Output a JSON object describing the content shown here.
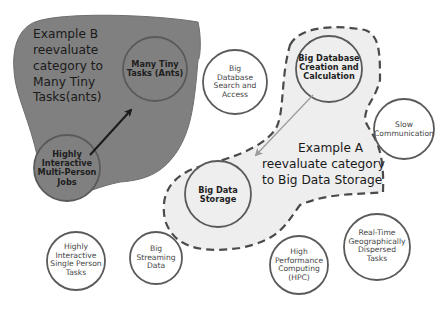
{
  "colors": {
    "region_b_fill": "#808080",
    "region_a_fill": "#eeeeee",
    "circle_stroke": "#5a5a5a",
    "circle_fill_white": "#ffffff",
    "arrow_b": "#1a1a1a",
    "arrow_a": "#9a9a9a"
  },
  "regions": {
    "example_b": {
      "note_lines": [
        "Example B",
        "reevaluate",
        "category  to",
        "Many Tiny",
        "Tasks(ants)"
      ]
    },
    "example_a": {
      "note_lines": [
        "Example A",
        "reevaluate category",
        "to Big Data Storage"
      ]
    }
  },
  "nodes": {
    "many_tiny_tasks": {
      "lines": [
        "Many Tiny",
        "Tasks (Ants)"
      ],
      "style": "bold",
      "region": "example_b"
    },
    "highly_interactive_multi_person": {
      "lines": [
        "Highly",
        "Interactive",
        "Multi-Person",
        "Jobs"
      ],
      "style": "bold",
      "region": "example_b"
    },
    "big_database_search": {
      "lines": [
        "Big",
        "Database",
        "Search and",
        "Access"
      ],
      "style": "small",
      "region": "none"
    },
    "big_database_creation": {
      "lines": [
        "Big Database",
        "Creation and",
        "Calculation"
      ],
      "style": "bold",
      "region": "example_a"
    },
    "big_data_storage": {
      "lines": [
        "Big Data",
        "Storage"
      ],
      "style": "bold",
      "region": "example_a"
    },
    "slow_communication": {
      "lines": [
        "Slow",
        "Communication"
      ],
      "style": "small",
      "region": "none"
    },
    "highly_interactive_single_person": {
      "lines": [
        "Highly",
        "Interactive",
        "Single Person",
        "Tasks"
      ],
      "style": "small",
      "region": "none"
    },
    "big_streaming_data": {
      "lines": [
        "Big",
        "Streaming",
        "Data"
      ],
      "style": "small",
      "region": "none"
    },
    "hpc": {
      "lines": [
        "High",
        "Performance",
        "Computing",
        "(HPC)"
      ],
      "style": "small",
      "region": "none"
    },
    "real_time_geo": {
      "lines": [
        "Real-Time",
        "Geographically",
        "Dispersed",
        "Tasks"
      ],
      "style": "small",
      "region": "none"
    }
  },
  "arrows": [
    {
      "from": "highly_interactive_multi_person",
      "to": "many_tiny_tasks",
      "style": "dark"
    },
    {
      "from": "big_database_creation",
      "to": "big_data_storage",
      "style": "light"
    }
  ]
}
